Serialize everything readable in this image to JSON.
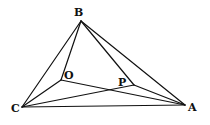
{
  "figure": {
    "type": "geometry-diagram",
    "width": 210,
    "height": 125,
    "stroke_color": "#111111",
    "background": "#ffffff"
  },
  "points": {
    "A": {
      "label": "A",
      "x": 185,
      "y": 105,
      "label_x": 188,
      "label_y": 111
    },
    "B": {
      "label": "B",
      "x": 81,
      "y": 21,
      "label_x": 74,
      "label_y": 16
    },
    "C": {
      "label": "C",
      "x": 22,
      "y": 107,
      "label_x": 11,
      "label_y": 112
    },
    "O": {
      "label": "O",
      "x": 61,
      "y": 80,
      "label_x": 64,
      "label_y": 79
    },
    "P": {
      "label": "P",
      "x": 134,
      "y": 85,
      "label_x": 118,
      "label_y": 86
    }
  },
  "segments": [
    {
      "name": "segment-BC",
      "from": "B",
      "to": "C"
    },
    {
      "name": "segment-BA",
      "from": "B",
      "to": "A"
    },
    {
      "name": "segment-CA",
      "from": "C",
      "to": "A"
    },
    {
      "name": "segment-BO",
      "from": "B",
      "to": "O"
    },
    {
      "name": "segment-OC",
      "from": "O",
      "to": "C"
    },
    {
      "name": "segment-OA",
      "from": "O",
      "to": "A"
    },
    {
      "name": "segment-BP",
      "from": "B",
      "to": "P"
    },
    {
      "name": "segment-PA",
      "from": "P",
      "to": "A"
    },
    {
      "name": "segment-CP",
      "from": "C",
      "to": "P"
    }
  ]
}
